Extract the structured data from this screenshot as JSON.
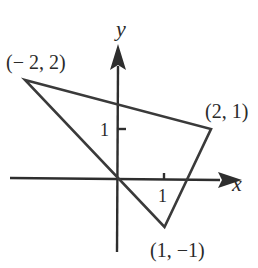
{
  "diagram": {
    "type": "triangle-on-coordinate-plane",
    "axes": {
      "x_label": "x",
      "y_label": "y",
      "x_tick": {
        "value": 1,
        "label": "1"
      },
      "y_tick": {
        "value": 1,
        "label": "1"
      }
    },
    "vertices": [
      {
        "x": -2,
        "y": 2,
        "label": "(− 2, 2)"
      },
      {
        "x": 2,
        "y": 1,
        "label": "(2, 1)"
      },
      {
        "x": 1,
        "y": -1,
        "label": "(1, −1)"
      }
    ],
    "colors": {
      "line": "#3a3a3a",
      "background": "#ffffff"
    }
  }
}
